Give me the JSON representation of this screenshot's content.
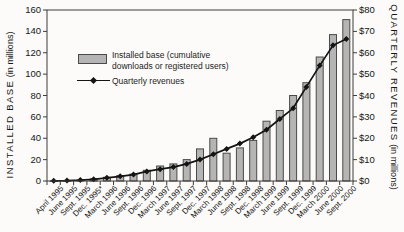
{
  "chart": {
    "legend": {
      "bar_label_line1": "Installed base (cumulative",
      "bar_label_line2": "downloads or registered users)",
      "line_label": "Quarterly revenues"
    },
    "left_axis": {
      "title_caps": "INSTALLED BASE",
      "title_sub": "(in millions)",
      "ticks": [
        "0",
        "20",
        "40",
        "60",
        "80",
        "100",
        "120",
        "140",
        "160"
      ]
    },
    "right_axis": {
      "title_caps": "QUARTERLY REVENUES",
      "title_sub": "(in millions)",
      "ticks": [
        "$0",
        "$10",
        "$20",
        "$30",
        "$40",
        "$50",
        "$60",
        "$70",
        "$80"
      ]
    },
    "colors": {
      "bar_fill": "#b5b5b5",
      "bar_border": "#4a4a4a",
      "line": "#141414",
      "axis": "#3d3d3d",
      "text": "#161616"
    }
  },
  "chart_data": {
    "type": "bar+line",
    "categories": [
      "April 1995",
      "June 1995",
      "Sept. 1995",
      "Dec. 1995*",
      "March 1996",
      "June 1996",
      "Sept. 1996",
      "Dec. 1996",
      "March 1997",
      "June 1997",
      "Sept. 1997",
      "Dec. 1997",
      "March 1998",
      "June 1998",
      "Sept. 1998",
      "Dec. 1998",
      "March 1999",
      "June 1999",
      "Sept. 1999",
      "Dec. 1999",
      "March 2000",
      "June 2000",
      "Sept. 2000"
    ],
    "series": [
      {
        "name": "Installed base (cumulative downloads or registered users)",
        "type": "bar",
        "axis": "left",
        "values": [
          0.1,
          0.3,
          0.8,
          2,
          3.5,
          5,
          6.5,
          10,
          14,
          16,
          20,
          30,
          40,
          26,
          31,
          38,
          56,
          66,
          80,
          92,
          116,
          137,
          151
        ]
      },
      {
        "name": "Quarterly revenues",
        "type": "line",
        "axis": "right",
        "values": [
          0.1,
          0.2,
          0.4,
          0.8,
          1.5,
          2.2,
          3,
          4.5,
          5.5,
          6.5,
          8,
          10,
          12.5,
          15,
          17.5,
          20.5,
          24,
          29,
          34,
          44,
          54,
          63.5,
          66.5
        ]
      }
    ],
    "title": "",
    "xlabel": "",
    "ylabel_left": "INSTALLED BASE (in millions)",
    "ylabel_right": "QUARTERLY REVENUES (in millions)",
    "left_ylim": [
      0,
      160
    ],
    "right_ylim": [
      0,
      80
    ],
    "grid": false,
    "legend_position": "upper-left-inside"
  }
}
